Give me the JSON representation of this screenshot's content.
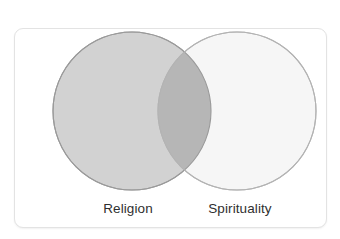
{
  "figure": {
    "type": "venn-diagram",
    "background_color": "#ffffff",
    "card": {
      "background_color": "#ffffff",
      "border_color": "#e3e3e3"
    },
    "sets": [
      {
        "id": "religion",
        "label": "Religion",
        "fill_color": "#d2d2d2",
        "stroke_color": "#9a9a9a",
        "center_x": 117,
        "center_y": 82,
        "radius": 79
      },
      {
        "id": "spirituality",
        "label": "Spirituality",
        "fill_color": "#f5f5f5",
        "stroke_color": "#b3b3b3",
        "center_x": 222,
        "center_y": 82,
        "radius": 79
      }
    ],
    "intersection": {
      "id": "religion-spirituality-overlap",
      "label": "",
      "fill_color": "#b6b6b6"
    },
    "label_color": "#2f2f2f"
  }
}
